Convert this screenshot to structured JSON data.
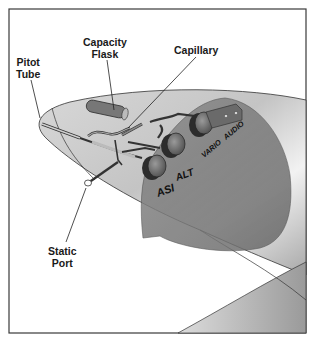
{
  "diagram": {
    "labels": {
      "pitot_tube": [
        "Pitot",
        "Tube"
      ],
      "capacity_flask": [
        "Capacity",
        "Flask"
      ],
      "capillary": "Capillary",
      "static_port": [
        "Static",
        "Port"
      ]
    },
    "instruments": {
      "asi": "ASI",
      "alt": "ALT",
      "vario": "VARIO",
      "audio": "AUDIO"
    },
    "colors": {
      "frame": "#3a3a3a",
      "fuselage_light": "#e6e6e6",
      "fuselage_mid": "#b5b5b5",
      "panel": "#7d7d7d",
      "gauge": "#4a4a4a",
      "text": "#1a1a1a"
    }
  }
}
